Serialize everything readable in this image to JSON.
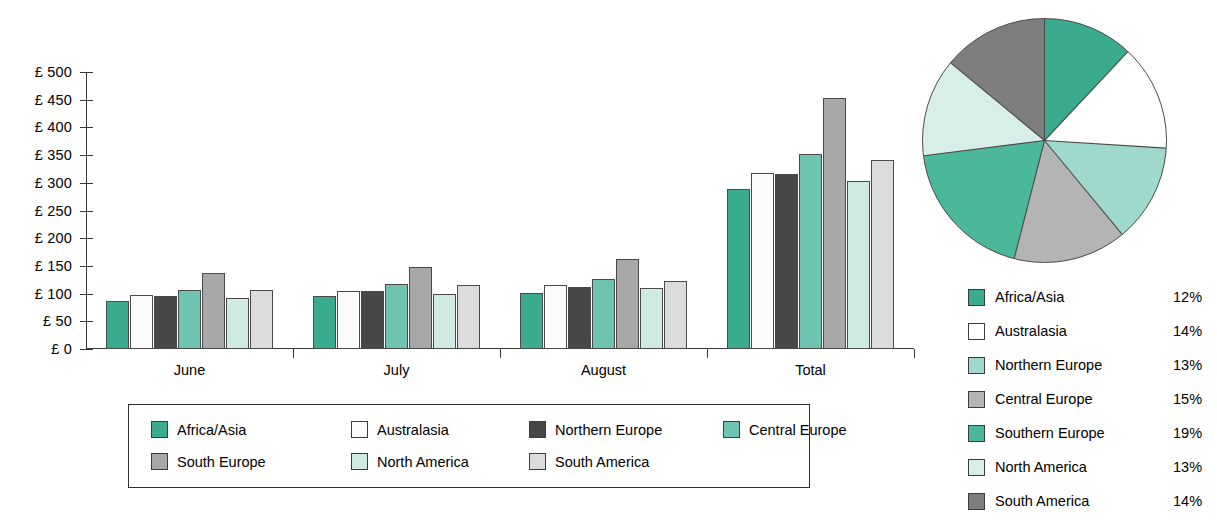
{
  "chart_data": [
    {
      "type": "bar",
      "title": "",
      "xlabel": "",
      "ylabel": "",
      "categories": [
        "June",
        "July",
        "August",
        "Total"
      ],
      "ylim": [
        0,
        500
      ],
      "ytick_labels": [
        "£ 0",
        "£ 50",
        "£ 100",
        "£ 150",
        "£ 200",
        "£ 250",
        "£ 300",
        "£ 350",
        "£ 400",
        "£ 450",
        "£ 500"
      ],
      "ytick_values": [
        0,
        50,
        100,
        150,
        200,
        250,
        300,
        350,
        400,
        450,
        500
      ],
      "grid": false,
      "legend_position": "bottom",
      "series": [
        {
          "name": "Africa/Asia",
          "color": "#3aab8e",
          "values": [
            87,
            95,
            102,
            288
          ]
        },
        {
          "name": "Australasia",
          "color": "#fbfbfb",
          "values": [
            97,
            105,
            115,
            318
          ]
        },
        {
          "name": "Northern Europe",
          "color": "#474747",
          "values": [
            95,
            105,
            112,
            316
          ]
        },
        {
          "name": "Central Europe",
          "color": "#6ec4b0",
          "values": [
            107,
            117,
            127,
            352
          ]
        },
        {
          "name": "South Europe",
          "color": "#a8a8a8",
          "values": [
            138,
            148,
            163,
            453
          ]
        },
        {
          "name": "North America",
          "color": "#cfeae2",
          "values": [
            92,
            100,
            110,
            304
          ]
        },
        {
          "name": "South America",
          "color": "#dcdcdc",
          "values": [
            106,
            115,
            123,
            341
          ]
        }
      ]
    },
    {
      "type": "pie",
      "title": "",
      "legend_position": "below",
      "start_angle_deg": 0,
      "direction": "clockwise",
      "labels": [
        "Africa/Asia",
        "Australasia",
        "Northern Europe",
        "Central Europe",
        "Southern Europe",
        "North America",
        "South America"
      ],
      "values": [
        12,
        14,
        13,
        15,
        19,
        13,
        14
      ],
      "value_labels": [
        "12%",
        "14%",
        "13%",
        "15%",
        "19%",
        "13%",
        "14%"
      ],
      "colors": [
        "#3aab8e",
        "#ffffff",
        "#9fd9cd",
        "#b4b4b4",
        "#4bb89b",
        "#d7efe8",
        "#7e7e7e"
      ]
    }
  ],
  "bar_legend": {
    "items": [
      {
        "label": "Africa/Asia",
        "color": "#3aab8e"
      },
      {
        "label": "Australasia",
        "color": "#fbfbfb"
      },
      {
        "label": "Northern Europe",
        "color": "#474747"
      },
      {
        "label": "Central Europe",
        "color": "#6ec4b0"
      },
      {
        "label": "South Europe",
        "color": "#a8a8a8"
      },
      {
        "label": "North America",
        "color": "#cfeae2"
      },
      {
        "label": "South America",
        "color": "#dcdcdc"
      }
    ]
  },
  "pie_legend": {
    "items": [
      {
        "label": "Africa/Asia",
        "pct": "12%",
        "color": "#3aab8e"
      },
      {
        "label": "Australasia",
        "pct": "14%",
        "color": "#ffffff"
      },
      {
        "label": "Northern Europe",
        "pct": "13%",
        "color": "#9fd9cd"
      },
      {
        "label": "Central Europe",
        "pct": "15%",
        "color": "#b4b4b4"
      },
      {
        "label": "Southern Europe",
        "pct": "19%",
        "color": "#4bb89b"
      },
      {
        "label": "North America",
        "pct": "13%",
        "color": "#d7efe8"
      },
      {
        "label": "South America",
        "pct": "14%",
        "color": "#7e7e7e"
      }
    ]
  }
}
